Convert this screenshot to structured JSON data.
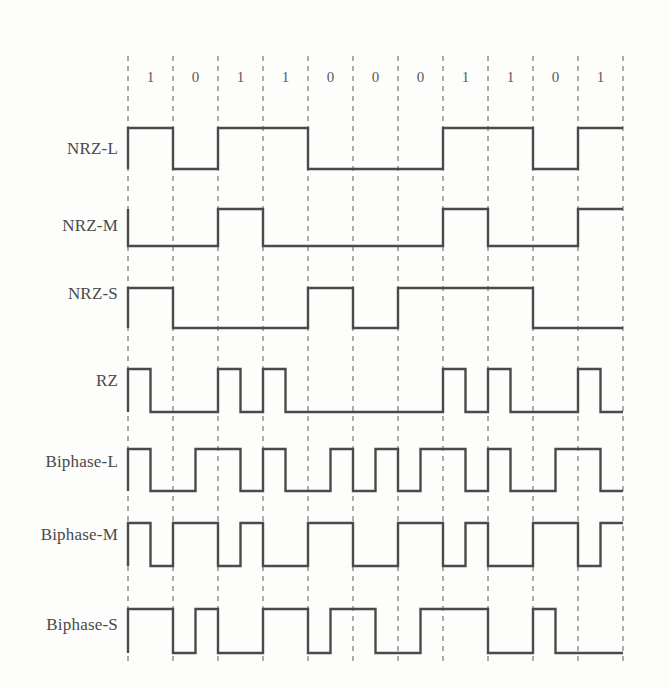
{
  "figure": {
    "background_color": "#fdfdfc",
    "wave_color": "#4a4a4a",
    "grid_color": "#8a8a8a",
    "label_color": "#4a4a4a"
  },
  "bits": [
    "1",
    "0",
    "1",
    "1",
    "0",
    "0",
    "0",
    "1",
    "1",
    "0",
    "1"
  ],
  "rows": [
    {
      "label": "NRZ-L",
      "levels": [
        1,
        0,
        1,
        1,
        0,
        0,
        0,
        1,
        1,
        0,
        1
      ]
    },
    {
      "label": "NRZ-M",
      "levels": [
        0,
        0,
        1,
        0,
        0,
        0,
        0,
        1,
        0,
        0,
        1
      ]
    },
    {
      "label": "NRZ-S",
      "levels": [
        1,
        0,
        0,
        0,
        1,
        0,
        1,
        1,
        1,
        0,
        0
      ]
    },
    {
      "label": "RZ",
      "halves": [
        [
          1,
          0
        ],
        [
          0,
          0
        ],
        [
          1,
          0
        ],
        [
          1,
          0
        ],
        [
          0,
          0
        ],
        [
          0,
          0
        ],
        [
          0,
          0
        ],
        [
          1,
          0
        ],
        [
          1,
          0
        ],
        [
          0,
          0
        ],
        [
          1,
          0
        ]
      ]
    },
    {
      "label": "Biphase-L",
      "halves": [
        [
          1,
          0
        ],
        [
          0,
          1
        ],
        [
          1,
          0
        ],
        [
          1,
          0
        ],
        [
          0,
          1
        ],
        [
          0,
          1
        ],
        [
          0,
          1
        ],
        [
          1,
          0
        ],
        [
          1,
          0
        ],
        [
          0,
          1
        ],
        [
          1,
          0
        ]
      ]
    },
    {
      "label": "Biphase-M",
      "halves": [
        [
          1,
          0
        ],
        [
          1,
          1
        ],
        [
          0,
          1
        ],
        [
          0,
          0
        ],
        [
          1,
          1
        ],
        [
          0,
          0
        ],
        [
          1,
          1
        ],
        [
          0,
          1
        ],
        [
          0,
          0
        ],
        [
          1,
          1
        ],
        [
          0,
          1
        ]
      ]
    },
    {
      "label": "Biphase-S",
      "halves": [
        [
          1,
          1
        ],
        [
          0,
          1
        ],
        [
          0,
          0
        ],
        [
          1,
          1
        ],
        [
          0,
          1
        ],
        [
          1,
          0
        ],
        [
          0,
          1
        ],
        [
          1,
          1
        ],
        [
          0,
          0
        ],
        [
          1,
          0
        ],
        [
          0,
          0
        ]
      ]
    }
  ],
  "geometry": {
    "grid_left": 128,
    "bit_width": 45,
    "bit_count": 11,
    "grid_top": 56,
    "grid_bottom": 661,
    "label_x": 118,
    "bit_label_y": 82,
    "rows_y": [
      {
        "high": 128,
        "low": 169,
        "label_y": 154
      },
      {
        "high": 209,
        "low": 246,
        "label_y": 231
      },
      {
        "high": 288,
        "low": 328,
        "label_y": 299
      },
      {
        "high": 369,
        "low": 412,
        "label_y": 386
      },
      {
        "high": 449,
        "low": 491,
        "label_y": 467
      },
      {
        "high": 523,
        "low": 566,
        "label_y": 540
      },
      {
        "high": 609,
        "low": 653,
        "label_y": 630
      }
    ]
  },
  "chart_data": {
    "type": "line",
    "xlabel": "",
    "ylabel": "",
    "categories": [
      "1",
      "0",
      "1",
      "1",
      "0",
      "0",
      "0",
      "1",
      "1",
      "0",
      "1"
    ],
    "series": [
      {
        "name": "NRZ-L",
        "values": [
          1,
          0,
          1,
          1,
          0,
          0,
          0,
          1,
          1,
          0,
          1
        ]
      },
      {
        "name": "NRZ-M",
        "values": [
          0,
          0,
          1,
          0,
          0,
          0,
          0,
          1,
          0,
          0,
          1
        ]
      },
      {
        "name": "NRZ-S",
        "values": [
          1,
          0,
          0,
          0,
          1,
          0,
          1,
          1,
          1,
          0,
          0
        ]
      },
      {
        "name": "RZ",
        "values": [
          [
            1,
            0
          ],
          [
            0,
            0
          ],
          [
            1,
            0
          ],
          [
            1,
            0
          ],
          [
            0,
            0
          ],
          [
            0,
            0
          ],
          [
            0,
            0
          ],
          [
            1,
            0
          ],
          [
            1,
            0
          ],
          [
            0,
            0
          ],
          [
            1,
            0
          ]
        ]
      },
      {
        "name": "Biphase-L",
        "values": [
          [
            1,
            0
          ],
          [
            0,
            1
          ],
          [
            1,
            0
          ],
          [
            1,
            0
          ],
          [
            0,
            1
          ],
          [
            0,
            1
          ],
          [
            0,
            1
          ],
          [
            1,
            0
          ],
          [
            1,
            0
          ],
          [
            0,
            1
          ],
          [
            1,
            0
          ]
        ]
      },
      {
        "name": "Biphase-M",
        "values": [
          [
            1,
            0
          ],
          [
            1,
            1
          ],
          [
            0,
            1
          ],
          [
            0,
            0
          ],
          [
            1,
            1
          ],
          [
            0,
            0
          ],
          [
            1,
            1
          ],
          [
            0,
            1
          ],
          [
            0,
            0
          ],
          [
            1,
            1
          ],
          [
            0,
            1
          ]
        ]
      },
      {
        "name": "Biphase-S",
        "values": [
          [
            1,
            1
          ],
          [
            0,
            1
          ],
          [
            0,
            0
          ],
          [
            1,
            1
          ],
          [
            0,
            1
          ],
          [
            1,
            0
          ],
          [
            0,
            1
          ],
          [
            1,
            1
          ],
          [
            0,
            0
          ],
          [
            1,
            0
          ],
          [
            0,
            0
          ]
        ]
      }
    ],
    "ylim": [
      0,
      1
    ],
    "grid": true,
    "legend": "none"
  }
}
